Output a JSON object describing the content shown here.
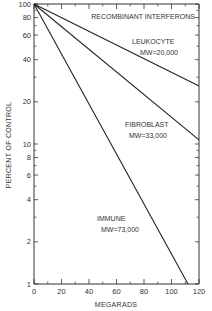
{
  "chart_data": {
    "type": "line",
    "title": "",
    "xlabel": "MEGARADS",
    "ylabel": "PERCENT OF CONTROL",
    "xlim": [
      0,
      120
    ],
    "ylim": [
      1,
      100
    ],
    "yscale": "log",
    "grid": false,
    "x_ticks": [
      0,
      20,
      40,
      60,
      80,
      100,
      120
    ],
    "x_tick_labels": [
      "0",
      "20",
      "40",
      "60",
      "80",
      "100",
      "120"
    ],
    "y_ticks": [
      1,
      2,
      4,
      6,
      8,
      10,
      20,
      40,
      60,
      80,
      100
    ],
    "y_tick_labels": [
      "1",
      "2",
      "4",
      "6",
      "8",
      "10",
      "20",
      "40",
      "60",
      "80",
      "100"
    ],
    "annotations": [
      {
        "text": "RECOMBINANT INTERFERONS"
      },
      {
        "text": "LEUKOCYTE",
        "text2": "MW=20,000"
      },
      {
        "text": "FIBROBLAST",
        "text2": "MW=33,000"
      },
      {
        "text": "IMMUNE",
        "text2": "MW=73,000"
      }
    ],
    "series": [
      {
        "name": "Leukocyte MW=20,000",
        "x": [
          0,
          120
        ],
        "values": [
          100,
          26
        ]
      },
      {
        "name": "Fibroblast MW=33,000",
        "x": [
          0,
          120
        ],
        "values": [
          100,
          10.7
        ]
      },
      {
        "name": "Immune MW=73,000",
        "x": [
          0,
          112
        ],
        "values": [
          100,
          1
        ]
      }
    ]
  }
}
